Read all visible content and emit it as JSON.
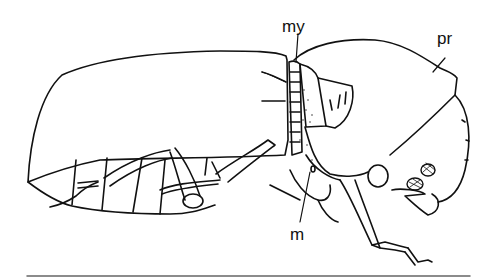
{
  "figure": {
    "labels": {
      "my": "my",
      "pr": "pr",
      "m": "m"
    },
    "colors": {
      "ink": "#111111",
      "background": "#ffffff",
      "rule": "#666666"
    }
  }
}
